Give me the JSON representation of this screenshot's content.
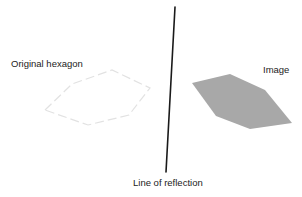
{
  "diagram": {
    "labels": {
      "original": "Original hexagon",
      "image": "Image",
      "line": "Line of reflection"
    },
    "colors": {
      "background": "#ffffff",
      "original_stroke": "#e2e2e2",
      "image_fill": "#a8a8a8",
      "line": "#1a1a1a",
      "text": "#222222"
    },
    "original_hexagon": {
      "points": "45,110 72,84 112,70 150,88 129,115 88,125",
      "style": "dashed outline"
    },
    "image_hexagon": {
      "points": "192,83 230,74 265,90 292,123 250,129 216,116",
      "style": "filled gray"
    },
    "reflection_line": {
      "x1": 175,
      "y1": 7,
      "x2": 166,
      "y2": 172
    }
  }
}
